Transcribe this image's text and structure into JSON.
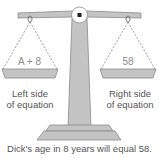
{
  "diagram": {
    "left_pan_text": "A + 8",
    "right_pan_text": "58",
    "left_label_line1": "Left side",
    "left_label_line2": "of equation",
    "right_label_line1": "Right side",
    "right_label_line2": "of equation",
    "caption": "Dick's age in 8 years will equal 58.",
    "colors": {
      "metal_fill": "#c4c4c4",
      "metal_stroke": "#8a8a8a",
      "string": "#777777",
      "text": "#555555"
    }
  }
}
